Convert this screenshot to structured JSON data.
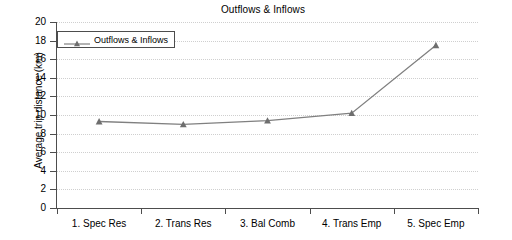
{
  "chart_data": {
    "type": "line",
    "title": "Outflows & Inflows",
    "xlabel": "",
    "ylabel": "Average trip distance (km)",
    "categories": [
      "1. Spec Res",
      "2. Trans Res",
      "3. Bal Comb",
      "4. Trans Emp",
      "5. Spec Emp"
    ],
    "series": [
      {
        "name": "Outflows & Inflows",
        "values": [
          9.3,
          9.0,
          9.4,
          10.2,
          17.5
        ],
        "color": "#808080",
        "marker": "triangle"
      }
    ],
    "ylim": [
      0,
      20
    ],
    "ytick_step": 2,
    "yticks": [
      20,
      18,
      16,
      14,
      12,
      10,
      8,
      6,
      4,
      2,
      0
    ],
    "grid": "horizontal-dotted",
    "legend_position": "top-left"
  },
  "legend": {
    "entries": [
      {
        "label": "Outflows & Inflows"
      }
    ]
  }
}
